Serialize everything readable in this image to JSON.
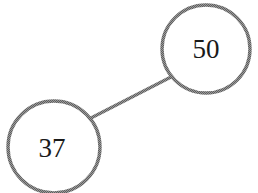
{
  "diagram": {
    "type": "binary-tree",
    "colors": {
      "stroke": "#7a7a7a",
      "fill": "#ffffff",
      "text": "#1a1a1a"
    },
    "nodes": [
      {
        "id": "n50",
        "label": "50",
        "role": "root",
        "cx": 206,
        "cy": 49,
        "r": 44
      },
      {
        "id": "n37",
        "label": "37",
        "role": "left-child",
        "cx": 54,
        "cy": 147,
        "r": 46
      }
    ],
    "edges": [
      {
        "from": "n50",
        "to": "n37",
        "x1": 171,
        "y1": 77,
        "x2": 89,
        "y2": 119
      }
    ]
  }
}
